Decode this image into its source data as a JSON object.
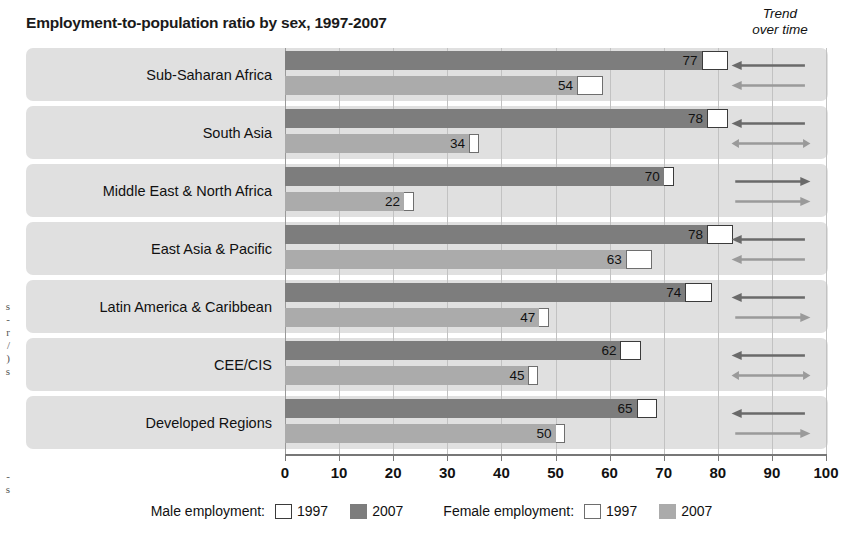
{
  "chart_data": {
    "type": "bar",
    "orientation": "horizontal",
    "title": "Employment-to-population ratio by sex, 1997-2007",
    "xlabel": "",
    "ylabel": "",
    "xlim": [
      0,
      100
    ],
    "xticks": [
      0,
      10,
      20,
      30,
      40,
      50,
      60,
      70,
      80,
      90,
      100
    ],
    "xtick_labels": [
      "0",
      "10",
      "20",
      "30",
      "40",
      "50",
      "60",
      "70",
      "80",
      "90",
      "100"
    ],
    "grid": true,
    "legend_position": "bottom",
    "categories": [
      "Sub-Saharan Africa",
      "South Asia",
      "Middle East & North Africa",
      "East Asia & Pacific",
      "Latin America & Caribbean",
      "CEE/CIS",
      "Developed Regions"
    ],
    "series": [
      {
        "name": "Male employment 2007",
        "sex": "male",
        "year": "2007",
        "color": "#7d7d7d",
        "values": [
          77,
          78,
          70,
          78,
          74,
          62,
          65
        ]
      },
      {
        "name": "Male employment 1997",
        "sex": "male",
        "year": "1997",
        "color": "#ffffff",
        "marker": "outline",
        "values": [
          80,
          80,
          69,
          81,
          77,
          64,
          67
        ]
      },
      {
        "name": "Female employment 2007",
        "sex": "female",
        "year": "2007",
        "color": "#ababab",
        "values": [
          54,
          34,
          22,
          63,
          47,
          45,
          50
        ]
      },
      {
        "name": "Female employment 1997",
        "sex": "female",
        "year": "1997",
        "color": "#ffffff",
        "marker": "outline",
        "values": [
          57,
          34,
          19,
          66,
          44,
          45,
          47
        ]
      }
    ],
    "data_labels": {
      "male": [
        "77",
        "78",
        "70",
        "78",
        "74",
        "62",
        "65"
      ],
      "female": [
        "54",
        "34",
        "22",
        "63",
        "47",
        "45",
        "50"
      ]
    },
    "trend_over_time": {
      "header_line1": "Trend",
      "header_line2": "over time",
      "male": [
        "decrease",
        "decrease",
        "increase",
        "decrease",
        "decrease",
        "decrease",
        "decrease"
      ],
      "female": [
        "decrease",
        "no-change",
        "increase",
        "decrease",
        "increase",
        "no-change",
        "increase"
      ]
    }
  },
  "title": "Employment-to-population ratio by sex, 1997-2007",
  "trend": {
    "header_line1": "Trend",
    "header_line2": "over time"
  },
  "legend": {
    "male_title": "Male employment:",
    "female_title": "Female employment:",
    "year_1997": "1997",
    "year_2007": "2007"
  },
  "edge_bleed": {
    "fragment_upper": "s\n-\nr\n/\n)\ns",
    "fragment_lower": "-\ns"
  }
}
